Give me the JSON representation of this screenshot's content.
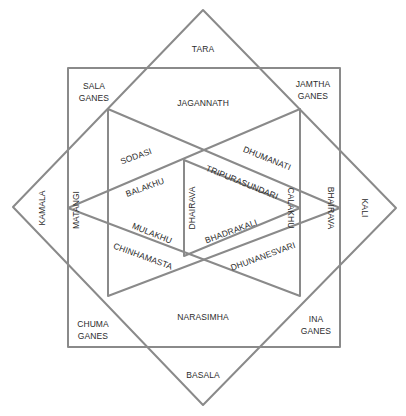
{
  "diagram": {
    "type": "yantra-grid",
    "line_color": "#8a8a8a",
    "text_color": "#2b2b2b",
    "background": "#ffffff",
    "shapes": {
      "outer_diamond": [
        [
          203,
          10
        ],
        [
          396,
          208
        ],
        [
          203,
          405
        ],
        [
          13,
          207
        ]
      ],
      "square": {
        "x": 68,
        "y": 68,
        "w": 272,
        "h": 279
      },
      "left_pointing_triangle": [
        [
          300,
          109
        ],
        [
          300,
          296
        ],
        [
          68,
          208
        ]
      ],
      "right_pointing_triangle": [
        [
          108,
          109
        ],
        [
          108,
          296
        ],
        [
          340,
          208
        ]
      ],
      "inner_triangle": [
        [
          184,
          160
        ],
        [
          184,
          256
        ],
        [
          300,
          208
        ]
      ]
    },
    "labels": {
      "tara": "TARA",
      "sala_line1": "SALA",
      "sala_line2": "GANES",
      "jamtha_line1": "JAMTHA",
      "jamtha_line2": "GANES",
      "jagannath": "JAGANNATH",
      "sodasi": "SODASI",
      "dhumanati": "DHUMANATI",
      "balakhu": "BALAKHU",
      "tripurasundari": "TRIPURASUNDARI",
      "kamala": "KAMALA",
      "matangi": "MATANGI",
      "dhairava": "DHAIRAVA",
      "calakhu": "CALAKHU",
      "bhairava": "BHAIRAVA",
      "kali": "KALI",
      "bhadrakali": "BHADRAKALI",
      "mulakhu": "MULAKHU",
      "chinhamasta": "CHINHAMASTA",
      "dhunanesvari": "DHUNANESVARI",
      "narasimha": "NARASIMHA",
      "chuma_line1": "CHUMA",
      "chuma_line2": "GANES",
      "ina_line1": "INA",
      "ina_line2": "GANES",
      "basala": "BASALA"
    }
  }
}
